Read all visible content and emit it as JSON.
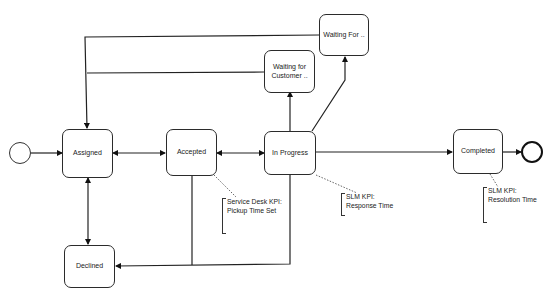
{
  "diagram": {
    "type": "BPMN process flow",
    "nodes": {
      "assigned": {
        "label": "Assigned"
      },
      "accepted": {
        "label": "Accepted"
      },
      "in_progress": {
        "label": "In Progress"
      },
      "completed": {
        "label": "Completed"
      },
      "declined": {
        "label": "Declined"
      },
      "waiting_customer": {
        "label": "Waiting for Customer .."
      },
      "waiting_for": {
        "label": "Waiting For .."
      }
    },
    "events": {
      "start": {
        "label": ""
      },
      "end": {
        "label": ""
      }
    },
    "annotations": {
      "pickup": {
        "line1": "Service Desk KPI:",
        "line2": "Pickup Time Set"
      },
      "response": {
        "line1": "SLM KPI:",
        "line2": "Response Time"
      },
      "resolution": {
        "line1": "SLM KPI:",
        "line2": "Resolution Time"
      }
    },
    "edges": [
      {
        "from": "start",
        "to": "Assigned"
      },
      {
        "from": "Assigned",
        "to": "Accepted",
        "bidirectional": true
      },
      {
        "from": "Accepted",
        "to": "In Progress",
        "bidirectional": true
      },
      {
        "from": "In Progress",
        "to": "Completed"
      },
      {
        "from": "Completed",
        "to": "end"
      },
      {
        "from": "Assigned",
        "to": "Declined",
        "bidirectional": true
      },
      {
        "from": "Accepted",
        "to": "Declined"
      },
      {
        "from": "In Progress",
        "to": "Declined"
      },
      {
        "from": "In Progress",
        "to": "Waiting for Customer .."
      },
      {
        "from": "In Progress",
        "to": "Waiting For .."
      },
      {
        "from": "Waiting for Customer ..",
        "to": "Assigned"
      },
      {
        "from": "Waiting For ..",
        "to": "Assigned"
      }
    ]
  }
}
